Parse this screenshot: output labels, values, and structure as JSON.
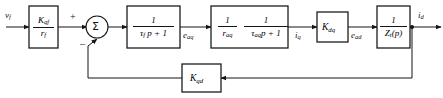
{
  "diagram": {
    "type": "control-system-block-diagram",
    "canvas": {
      "width": 443,
      "height": 98
    },
    "stroke_color": "#141414",
    "background_color": "#ffffff",
    "signals": {
      "input": {
        "base": "v",
        "sub": "f"
      },
      "after_block2": {
        "base": "e",
        "sub": "aq"
      },
      "after_block3": {
        "base": "i",
        "sub": "q"
      },
      "after_gain_kdq": {
        "base": "e",
        "sub": "ad"
      },
      "output": {
        "base": "i",
        "sub": "d"
      }
    },
    "summing_junction": {
      "glyph": "Σ",
      "plus_sign": "+",
      "minus_sign": "–"
    },
    "blocks": [
      {
        "id": "block-kqf-rf",
        "kind": "fraction",
        "numerator": {
          "base": "K",
          "sub": "qf"
        },
        "denominator": {
          "base": "r",
          "sub": "f"
        }
      },
      {
        "id": "block-tauf-lag",
        "kind": "fraction",
        "numerator_plain": "1",
        "denominator_parts": {
          "base": "τ",
          "sub": "f",
          "tail": "p + 1"
        }
      },
      {
        "id": "block-raq-tauaq",
        "kind": "dual-fraction",
        "left": {
          "numerator_plain": "1",
          "denominator": {
            "base": "r",
            "sub": "aq"
          }
        },
        "right": {
          "numerator_plain": "1",
          "denominator_parts": {
            "base": "τ",
            "sub": "aq",
            "tail": "p + 1"
          }
        }
      },
      {
        "id": "block-kdq",
        "kind": "gain",
        "label": {
          "base": "K",
          "sub": "dq"
        }
      },
      {
        "id": "block-zt",
        "kind": "fraction",
        "numerator_plain": "1",
        "denominator_parts": {
          "base": "Z",
          "sub": "t",
          "tail": "(p)"
        }
      },
      {
        "id": "block-kqd-feedback",
        "kind": "gain",
        "label": {
          "base": "K",
          "sub": "qd"
        }
      }
    ]
  }
}
